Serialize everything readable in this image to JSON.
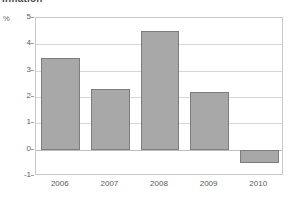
{
  "chart_data": {
    "type": "bar",
    "title": "Inflation",
    "xlabel": "",
    "ylabel": "%",
    "unit_label": "%",
    "categories": [
      "2006",
      "2007",
      "2008",
      "2009",
      "2010"
    ],
    "values": [
      3.5,
      2.3,
      4.5,
      2.2,
      -0.5
    ],
    "series": [
      {
        "name": "Inflation",
        "values": [
          3.5,
          2.3,
          4.5,
          2.2,
          -0.5
        ]
      }
    ],
    "ylim": [
      -1,
      5
    ],
    "yticks": [
      5,
      4,
      3,
      2,
      1,
      0,
      -1
    ],
    "ytick_labels": [
      "5",
      "4",
      "3",
      "2",
      "1",
      "0",
      "-1"
    ],
    "grid": true,
    "legend": false,
    "legend_position": "none",
    "colors": {
      "bar_fill": "#a8a8a8",
      "bar_border": "#7d7d7d",
      "gridline": "#d6d6d6",
      "zero_line": "#bdbdbd",
      "plot_border": "#c9c9c9",
      "text": "#5a5a5a",
      "background": "#ffffff"
    }
  }
}
